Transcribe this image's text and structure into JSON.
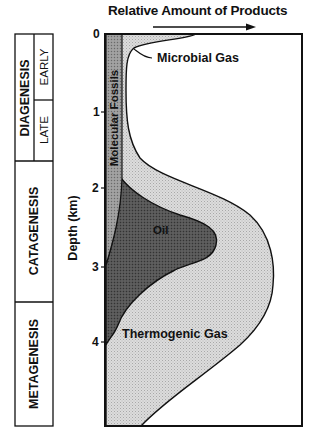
{
  "header": {
    "title": "Relative Amount of Products",
    "arrow": "right"
  },
  "yaxis": {
    "label": "Depth (km)",
    "ticks": [
      "0",
      "1",
      "2",
      "3",
      "4"
    ]
  },
  "stages": [
    {
      "name": "DIAGENESIS",
      "substages": [
        "EARLY",
        "LATE"
      ]
    },
    {
      "name": "CATAGENESIS",
      "substages": []
    },
    {
      "name": "METAGENESIS",
      "substages": []
    }
  ],
  "regions": {
    "molecular_fossils": "Molecular Fossils",
    "microbial_gas": "Microbial Gas",
    "oil": "Oil",
    "thermogenic_gas": "Thermogenic Gas"
  },
  "colors": {
    "gas_fill": "#d6d6d6",
    "oil_fill": "#5a5a5a",
    "fossil_fill": "#9a9a9a",
    "stroke": "#111111"
  }
}
